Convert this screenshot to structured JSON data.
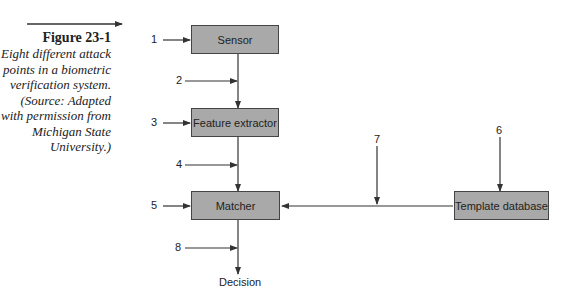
{
  "caption": {
    "title": "Figure 23-1",
    "body": "Eight different attack points in a biometric verification system. (Source: Adapted with permission from Michigan State University.)"
  },
  "boxes": {
    "sensor": "Sensor",
    "feature_extractor": "Feature extractor",
    "matcher": "Matcher",
    "template_database": "Template database"
  },
  "output_label": "Decision",
  "attack_points": [
    "1",
    "2",
    "3",
    "4",
    "5",
    "6",
    "7",
    "8"
  ],
  "colors": {
    "box_fill": "#a9a9a9",
    "line": "#333333"
  }
}
